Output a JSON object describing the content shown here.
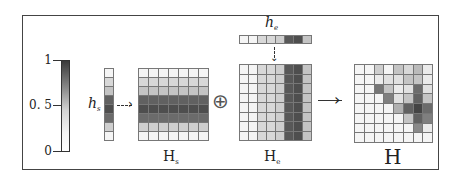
{
  "colorbar": {
    "ticks": [
      {
        "label": "1",
        "value": 1
      },
      {
        "label": "0. 5",
        "value": 0.5
      },
      {
        "label": "0",
        "value": 0
      }
    ],
    "low_color": "#ffffff",
    "high_color": "#3a3a3a"
  },
  "vectors": {
    "hs": {
      "label": "h",
      "sub": "s",
      "orientation": "column",
      "values": [
        0.05,
        0.2,
        0.3,
        0.8,
        0.9,
        0.75,
        0.25,
        0.05
      ]
    },
    "he": {
      "label": "h",
      "sub": "e",
      "orientation": "row",
      "values": [
        0.05,
        0.05,
        0.2,
        0.2,
        0.25,
        0.85,
        0.9,
        0.3
      ]
    }
  },
  "matrices": {
    "Hs": {
      "label": "H",
      "sub": "s",
      "rows": 8,
      "cols": 7,
      "values": [
        [
          0.05,
          0.05,
          0.05,
          0.05,
          0.05,
          0.05,
          0.05
        ],
        [
          0.2,
          0.2,
          0.2,
          0.2,
          0.2,
          0.2,
          0.2
        ],
        [
          0.3,
          0.3,
          0.3,
          0.3,
          0.3,
          0.3,
          0.3
        ],
        [
          0.8,
          0.8,
          0.8,
          0.8,
          0.8,
          0.8,
          0.8
        ],
        [
          0.9,
          0.9,
          0.9,
          0.9,
          0.9,
          0.9,
          0.9
        ],
        [
          0.75,
          0.75,
          0.75,
          0.75,
          0.75,
          0.75,
          0.75
        ],
        [
          0.25,
          0.25,
          0.25,
          0.25,
          0.25,
          0.25,
          0.25
        ],
        [
          0.05,
          0.05,
          0.05,
          0.05,
          0.05,
          0.05,
          0.05
        ]
      ]
    },
    "He": {
      "label": "H",
      "sub": "e",
      "rows": 8,
      "cols": 8,
      "values": [
        [
          0.05,
          0.05,
          0.2,
          0.2,
          0.25,
          0.85,
          0.9,
          0.3
        ],
        [
          0.05,
          0.05,
          0.2,
          0.2,
          0.25,
          0.85,
          0.9,
          0.3
        ],
        [
          0.05,
          0.05,
          0.2,
          0.2,
          0.25,
          0.85,
          0.9,
          0.3
        ],
        [
          0.05,
          0.05,
          0.2,
          0.2,
          0.25,
          0.85,
          0.9,
          0.3
        ],
        [
          0.05,
          0.05,
          0.2,
          0.2,
          0.25,
          0.85,
          0.9,
          0.3
        ],
        [
          0.05,
          0.05,
          0.2,
          0.2,
          0.25,
          0.85,
          0.9,
          0.3
        ],
        [
          0.05,
          0.05,
          0.2,
          0.2,
          0.25,
          0.85,
          0.9,
          0.3
        ],
        [
          0.05,
          0.05,
          0.2,
          0.2,
          0.25,
          0.85,
          0.9,
          0.3
        ]
      ]
    },
    "H": {
      "label": "H",
      "rows": 8,
      "cols": 8,
      "values": [
        [
          0.05,
          0.05,
          0.25,
          0.05,
          0.3,
          0.2,
          0.35,
          0.1
        ],
        [
          0.05,
          0.05,
          0.1,
          0.15,
          0.15,
          0.3,
          0.3,
          0.1
        ],
        [
          0.05,
          0.05,
          0.7,
          0.3,
          0.1,
          0.15,
          0.75,
          0.15
        ],
        [
          0.05,
          0.05,
          0.05,
          0.65,
          0.15,
          0.3,
          0.8,
          0.3
        ],
        [
          0.05,
          0.05,
          0.05,
          0.05,
          0.4,
          0.8,
          0.95,
          0.75
        ],
        [
          0.05,
          0.05,
          0.05,
          0.05,
          0.05,
          0.3,
          0.8,
          0.65
        ],
        [
          0.05,
          0.05,
          0.05,
          0.05,
          0.05,
          0.05,
          0.6,
          0.1
        ],
        [
          0.05,
          0.05,
          0.05,
          0.05,
          0.05,
          0.05,
          0.05,
          0.05
        ]
      ]
    }
  },
  "operators": {
    "plus": "⊕",
    "arrow": "→"
  }
}
